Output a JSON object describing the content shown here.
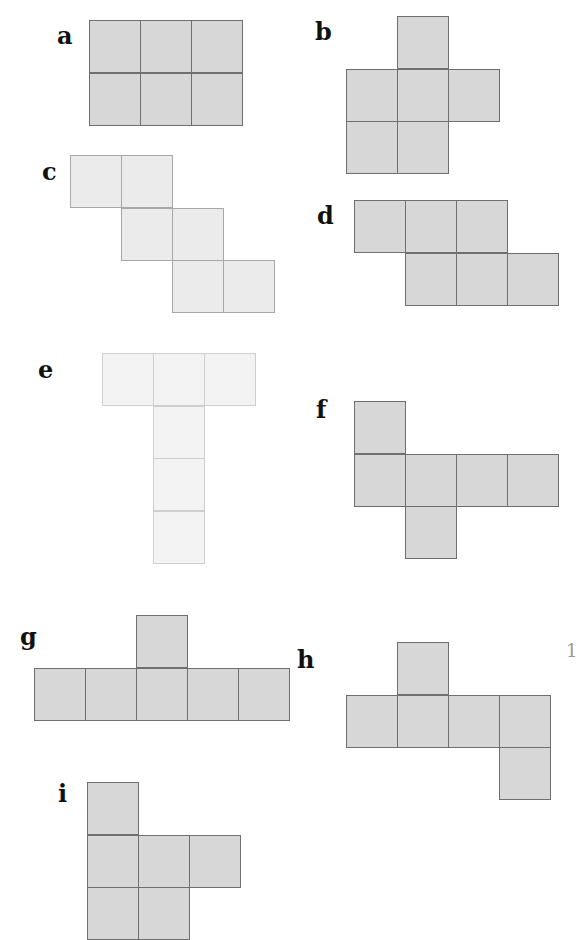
{
  "nets": [
    {
      "label": "a",
      "shade": "dark",
      "cells": [
        [
          0,
          0
        ],
        [
          1,
          0
        ],
        [
          2,
          0
        ],
        [
          0,
          1
        ],
        [
          1,
          1
        ],
        [
          2,
          1
        ]
      ]
    },
    {
      "label": "b",
      "shade": "dark",
      "cells": [
        [
          1,
          0
        ],
        [
          0,
          1
        ],
        [
          1,
          1
        ],
        [
          2,
          1
        ],
        [
          0,
          2
        ],
        [
          1,
          2
        ]
      ]
    },
    {
      "label": "c",
      "shade": "light",
      "cells": [
        [
          0,
          0
        ],
        [
          1,
          0
        ],
        [
          1,
          1
        ],
        [
          2,
          1
        ],
        [
          2,
          2
        ],
        [
          3,
          2
        ]
      ]
    },
    {
      "label": "d",
      "shade": "dark",
      "cells": [
        [
          0,
          0
        ],
        [
          1,
          0
        ],
        [
          2,
          0
        ],
        [
          1,
          1
        ],
        [
          2,
          1
        ],
        [
          3,
          1
        ]
      ]
    },
    {
      "label": "e",
      "shade": "pale",
      "cells": [
        [
          0,
          0
        ],
        [
          1,
          0
        ],
        [
          2,
          0
        ],
        [
          1,
          1
        ],
        [
          1,
          2
        ],
        [
          1,
          3
        ]
      ]
    },
    {
      "label": "f",
      "shade": "dark",
      "cells": [
        [
          0,
          0
        ],
        [
          0,
          1
        ],
        [
          1,
          1
        ],
        [
          2,
          1
        ],
        [
          3,
          1
        ],
        [
          1,
          2
        ]
      ]
    },
    {
      "label": "g",
      "shade": "dark",
      "cells": [
        [
          2,
          0
        ],
        [
          0,
          1
        ],
        [
          1,
          1
        ],
        [
          2,
          1
        ],
        [
          3,
          1
        ],
        [
          4,
          1
        ]
      ]
    },
    {
      "label": "h",
      "shade": "dark",
      "cells": [
        [
          1,
          0
        ],
        [
          0,
          1
        ],
        [
          1,
          1
        ],
        [
          2,
          1
        ],
        [
          3,
          1
        ],
        [
          3,
          2
        ]
      ]
    },
    {
      "label": "i",
      "shade": "dark",
      "cells": [
        [
          0,
          0
        ],
        [
          0,
          1
        ],
        [
          1,
          1
        ],
        [
          2,
          1
        ],
        [
          0,
          2
        ],
        [
          1,
          2
        ]
      ]
    }
  ],
  "edge_fragment": "1"
}
